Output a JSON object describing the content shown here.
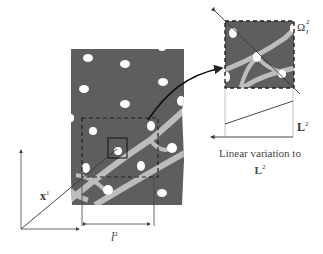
{
  "figure": {
    "labels": {
      "position_vector": "x",
      "position_vector_sup": "1",
      "cell_length": "l",
      "cell_length_sup": "2",
      "subdomain": "Ω",
      "subdomain_sub": "I",
      "subdomain_sup": "2",
      "macro_length": "L",
      "macro_length_sup": "2",
      "caption_line1": "Linear variation to",
      "caption_line2": "L",
      "caption_line2_sup": "2"
    },
    "colors": {
      "matrix": "#5e5e5e",
      "fibers": "#ffffff",
      "interphase": "#bdbdbd",
      "lines": "#222222"
    }
  }
}
